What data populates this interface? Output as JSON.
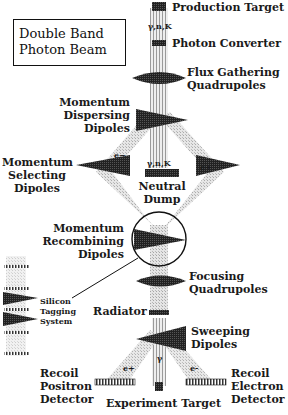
{
  "title": {
    "line1": "Double Band",
    "line2": "Photon Beam"
  },
  "labels": {
    "production_target": "Production Target",
    "gamma_n_k_top": "γ,n,K",
    "photon_converter": "Photon Converter",
    "flux_quads_1": "Flux Gathering",
    "flux_quads_2": "Quadrupoles",
    "disp_1": "Momentum",
    "disp_2": "Dispersing",
    "disp_3": "Dipoles",
    "sel_1": "Momentum",
    "sel_2": "Selecting",
    "sel_3": "Dipoles",
    "e_minus_left": "e−",
    "e_plus_right": "e+",
    "gamma_n_k_mid": "γ,n,K",
    "neutral_1": "Neutral",
    "neutral_2": "Dump",
    "recomb_1": "Momentum",
    "recomb_2": "Recombining",
    "recomb_3": "Dipoles",
    "focus_1": "Focusing",
    "focus_2": "Quadrupoles",
    "silicon_1": "Silicon",
    "silicon_2": "Tagging",
    "silicon_3": "System",
    "radiator": "Radiator",
    "sweep_1": "Sweeping",
    "sweep_2": "Dipoles",
    "e_plus_bottom": "e+",
    "e_minus_bottom": "e-",
    "gamma_bottom": "γ",
    "recoil_pos_1": "Recoil",
    "recoil_pos_2": "Positron",
    "recoil_pos_3": "Detector",
    "recoil_el_1": "Recoil",
    "recoil_el_2": "Electron",
    "recoil_el_3": "Detector",
    "experiment_target": "Experiment Target"
  },
  "colors": {
    "ink": "#1a1a1a",
    "beam": "#cfcfcf",
    "beam_dark": "#9a9a9a"
  }
}
